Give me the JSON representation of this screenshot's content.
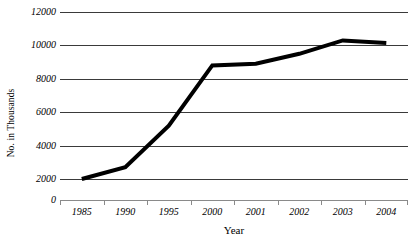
{
  "chart_data": {
    "type": "line",
    "title": "",
    "xlabel": "Year",
    "ylabel": "No. in Thousands",
    "categories": [
      "1985",
      "1990",
      "1995",
      "2000",
      "2001",
      "2002",
      "2003",
      "2004"
    ],
    "values": [
      2000,
      2700,
      5200,
      8800,
      8900,
      9500,
      10300,
      10150
    ],
    "series": [
      {
        "name": "No. in Thousands",
        "values": [
          2000,
          2700,
          5200,
          8800,
          8900,
          9500,
          10300,
          10150
        ]
      }
    ],
    "ylim": [
      0,
      12000
    ],
    "ytick_labels": [
      "12000",
      "10000",
      "8000",
      "6000",
      "4000",
      "2000",
      "0"
    ],
    "ytick_values": [
      12000,
      10000,
      8000,
      6000,
      4000,
      2000,
      0
    ],
    "grid": "horizontal",
    "legend": "none",
    "line_color": "#000000",
    "gridline_color": "#3a3a3a",
    "axis_color": "#8a8a8a"
  }
}
